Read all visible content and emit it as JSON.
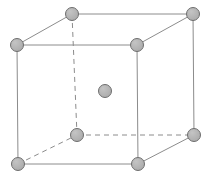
{
  "figure": {
    "name": "body-centered-cubic-unit-cell",
    "width": 209,
    "height": 183,
    "background_color": "#ffffff",
    "atom": {
      "fill_color": "#a9a9a9",
      "stroke_color": "#6e6e6e",
      "radius": 6.5,
      "stroke_width": 1
    },
    "edge": {
      "solid_color": "#8c8c8c",
      "dashed_color": "#8c8c8c",
      "stroke_width": 1,
      "dash_pattern": "5 4"
    },
    "atoms": [
      {
        "id": "top-back-left",
        "label": "top-back-left corner atom",
        "x": 72,
        "y": 14
      },
      {
        "id": "top-back-right",
        "label": "top-back-right corner atom",
        "x": 193,
        "y": 14
      },
      {
        "id": "top-front-left",
        "label": "top-front-left corner atom",
        "x": 17,
        "y": 45
      },
      {
        "id": "top-front-right",
        "label": "top-front-right corner atom",
        "x": 137,
        "y": 45
      },
      {
        "id": "body-center",
        "label": "body-center atom",
        "x": 105,
        "y": 91
      },
      {
        "id": "bottom-back-left",
        "label": "bottom-back-left corner atom",
        "x": 77,
        "y": 135
      },
      {
        "id": "bottom-back-right",
        "label": "bottom-back-right corner atom",
        "x": 194,
        "y": 135
      },
      {
        "id": "bottom-front-left",
        "label": "bottom-front-left corner atom",
        "x": 18,
        "y": 164
      },
      {
        "id": "bottom-front-right",
        "label": "bottom-front-right corner atom",
        "x": 138,
        "y": 164
      }
    ],
    "edges": [
      {
        "id": "top-front",
        "label": "top front edge",
        "style": "solid",
        "x1": 17,
        "y1": 45,
        "x2": 137,
        "y2": 45
      },
      {
        "id": "top-back",
        "label": "top back edge",
        "style": "solid",
        "x1": 72,
        "y1": 14,
        "x2": 193,
        "y2": 14
      },
      {
        "id": "top-left",
        "label": "top left edge",
        "style": "solid",
        "x1": 17,
        "y1": 45,
        "x2": 72,
        "y2": 14
      },
      {
        "id": "top-right",
        "label": "top right edge",
        "style": "solid",
        "x1": 137,
        "y1": 45,
        "x2": 193,
        "y2": 14
      },
      {
        "id": "bottom-front",
        "label": "bottom front edge",
        "style": "solid",
        "x1": 18,
        "y1": 164,
        "x2": 138,
        "y2": 164
      },
      {
        "id": "bottom-back",
        "label": "bottom back edge",
        "style": "dashed",
        "x1": 77,
        "y1": 135,
        "x2": 194,
        "y2": 135
      },
      {
        "id": "bottom-left",
        "label": "bottom left edge",
        "style": "dashed",
        "x1": 18,
        "y1": 164,
        "x2": 77,
        "y2": 135
      },
      {
        "id": "bottom-right",
        "label": "bottom right edge",
        "style": "solid",
        "x1": 138,
        "y1": 164,
        "x2": 194,
        "y2": 135
      },
      {
        "id": "vertical-front-left",
        "label": "front left vertical edge",
        "style": "solid",
        "x1": 17,
        "y1": 45,
        "x2": 18,
        "y2": 164
      },
      {
        "id": "vertical-front-right",
        "label": "front right vertical edge",
        "style": "solid",
        "x1": 137,
        "y1": 45,
        "x2": 138,
        "y2": 164
      },
      {
        "id": "vertical-back-left",
        "label": "back left vertical edge",
        "style": "dashed",
        "x1": 72,
        "y1": 14,
        "x2": 77,
        "y2": 135
      },
      {
        "id": "vertical-back-right",
        "label": "back right vertical edge",
        "style": "solid",
        "x1": 193,
        "y1": 14,
        "x2": 194,
        "y2": 135
      }
    ]
  }
}
